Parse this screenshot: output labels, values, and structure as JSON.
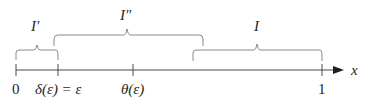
{
  "diagram": {
    "title": "",
    "axis": {
      "variable_label": "x",
      "line_color": "#4a4a4a",
      "ticks": [
        {
          "position": 0,
          "label": "0"
        },
        {
          "position": 0.137,
          "label": "δ(ε) = ε"
        },
        {
          "position": 0.382,
          "label": "θ(ε)"
        },
        {
          "position": 1,
          "label": "1"
        }
      ]
    },
    "intervals": [
      {
        "name": "I_prime",
        "label": "I′",
        "from_tick": "0",
        "to_tick": "δ(ε) = ε"
      },
      {
        "name": "I_double_prime",
        "label": "I″",
        "from": "slightly before δ(ε)",
        "to": "slightly after start of I"
      },
      {
        "name": "I",
        "label": "I",
        "from": "before 1",
        "to_tick": "1"
      }
    ],
    "bracket_color": "#8a8a8a",
    "text_color": "#1e1e1e"
  }
}
